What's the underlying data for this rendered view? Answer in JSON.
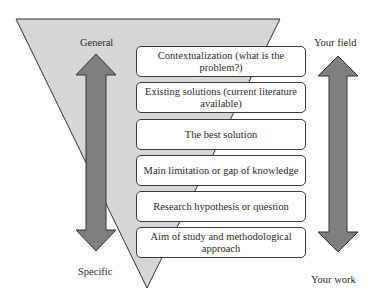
{
  "diagram": {
    "type": "funnel",
    "left_axis": {
      "top_label": "General",
      "bottom_label": "Specific"
    },
    "right_axis": {
      "top_label": "Your field",
      "bottom_label": "Your work"
    },
    "steps": [
      {
        "label": "Contextualization (what is the problem?)"
      },
      {
        "label": "Existing solutions (current literature available)"
      },
      {
        "label": "The best solution"
      },
      {
        "label": "Main limitation or gap of knowledge"
      },
      {
        "label": "Research hypothesis or question"
      },
      {
        "label": "Aim of study and methodological approach"
      }
    ],
    "colors": {
      "funnel_fill": "#d6d6d6",
      "arrow_fill": "#808080",
      "outline": "#333333",
      "box_fill": "#ffffff"
    }
  }
}
